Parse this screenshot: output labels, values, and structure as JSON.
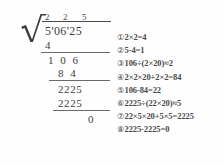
{
  "division": {
    "operation_name": "square-root-long-division",
    "radical_symbol": "√",
    "quotient_digits": [
      "2",
      "2",
      "5"
    ],
    "radicand": "5'06'25",
    "work_rows": [
      {
        "id": "subtrahend-1",
        "value": "4"
      },
      {
        "id": "bring-down-1",
        "value": "1 0 6"
      },
      {
        "id": "subtrahend-2",
        "value": "8 4"
      },
      {
        "id": "bring-down-2",
        "value": "2225"
      },
      {
        "id": "subtrahend-3",
        "value": "2225"
      },
      {
        "id": "remainder",
        "value": "0"
      }
    ]
  },
  "steps": [
    {
      "marker": "①",
      "text": "2×2=4"
    },
    {
      "marker": "②",
      "text": "5-4=1"
    },
    {
      "marker": "③",
      "text": "106÷(2×20)≈2"
    },
    {
      "marker": "④",
      "text": "2×2×20+2×2=84"
    },
    {
      "marker": "⑤",
      "text": "106-84=22"
    },
    {
      "marker": "⑥",
      "text": "2225÷(22×20)≈5"
    },
    {
      "marker": "⑦",
      "text": "22×5×20+5×5=2225"
    },
    {
      "marker": "⑧",
      "text": "2225-2225=0"
    }
  ],
  "colors": {
    "ink": "#3d3d3d",
    "rule": "#4a4a4a",
    "background": "#ffffff"
  }
}
